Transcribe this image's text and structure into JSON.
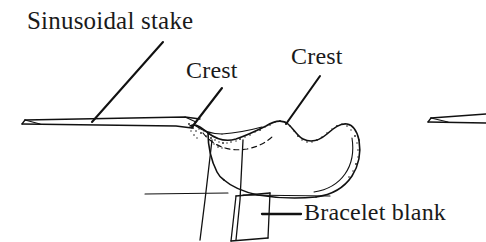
{
  "figure": {
    "kind": "line-art-technical-illustration",
    "background_color": "#ffffff",
    "ink_color": "#111111",
    "width": 486,
    "height": 242
  },
  "labels": {
    "sinusoidal_stake": "Sinusoidal stake",
    "crest_left": "Crest",
    "crest_right": "Crest",
    "bracelet_blank": "Bracelet blank"
  },
  "leaders": {
    "sinusoidal_stake": "diagonal-down-left",
    "crest_left": "diagonal-down-left",
    "crest_right": "diagonal-down-left",
    "bracelet_blank": "horizontal-left"
  },
  "parts": {
    "stake_bar": "long tapered wedge bar entering from left",
    "stake_tip_right": "second stake tip cropped at right edge",
    "sinusoidal_form": "wavy crested blank with stippled upper edge",
    "support_post": "vertical post below the form",
    "blank_strip": "angled quadrilateral strip at lower right",
    "bench_line": "horizontal reference rule"
  }
}
